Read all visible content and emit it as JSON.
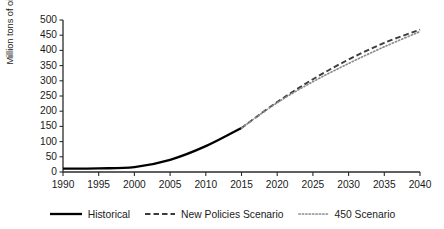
{
  "chart_data": {
    "type": "line",
    "title": "",
    "subtitle": "",
    "xlabel": "",
    "ylabel": "Million tons of oil equivalent",
    "xlim": [
      1990,
      2040
    ],
    "ylim": [
      0,
      500
    ],
    "xticks": [
      "1990",
      "1995",
      "2000",
      "2005",
      "2010",
      "2015",
      "2020",
      "2025",
      "2030",
      "2035",
      "2040"
    ],
    "xtick_values": [
      1990,
      1995,
      2000,
      2005,
      2010,
      2015,
      2020,
      2025,
      2030,
      2035,
      2040
    ],
    "yticks": [
      "0",
      "50",
      "100",
      "150",
      "200",
      "250",
      "300",
      "350",
      "400",
      "450",
      "500"
    ],
    "ytick_values": [
      0,
      50,
      100,
      150,
      200,
      250,
      300,
      350,
      400,
      450,
      500
    ],
    "grid": false,
    "legend_position": "bottom",
    "x": [
      1990,
      1995,
      2000,
      2005,
      2010,
      2015,
      2020,
      2025,
      2030,
      2035,
      2040
    ],
    "series": [
      {
        "name": "Historical",
        "style": "solid",
        "color": "#000000",
        "x": [
          1990,
          1995,
          2000,
          2005,
          2010,
          2015
        ],
        "values": [
          11,
          12,
          16,
          40,
          85,
          145
        ]
      },
      {
        "name": "New Policies Scenario",
        "style": "dashed",
        "color": "#3c3c3c",
        "x": [
          2015,
          2020,
          2025,
          2030,
          2035,
          2040
        ],
        "values": [
          145,
          230,
          305,
          370,
          425,
          468
        ]
      },
      {
        "name": "450 Scenario",
        "style": "dotted",
        "color": "#8c8c8c",
        "x": [
          2015,
          2020,
          2025,
          2030,
          2035,
          2040
        ],
        "values": [
          145,
          228,
          297,
          357,
          412,
          462
        ]
      }
    ],
    "legend": [
      "Historical",
      "New Policies Scenario",
      "450 Scenario"
    ]
  },
  "axis": {
    "y_title": "Million tons of oil equivalent"
  }
}
